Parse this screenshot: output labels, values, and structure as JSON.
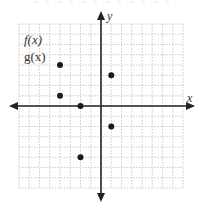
{
  "figure": {
    "top_cropped_text": "{ ... }",
    "axis_labels": {
      "x": "x",
      "y": "y"
    },
    "function_labels": [
      {
        "text": "f(x)"
      },
      {
        "text": "g(x)"
      }
    ],
    "colors": {
      "axis": "#222222",
      "grid": "#bdbdbd",
      "point": "#1a1a1a",
      "text": "#333333"
    }
  },
  "chart_data": {
    "type": "scatter",
    "title": "",
    "xlabel": "x",
    "ylabel": "y",
    "xlim": [
      -8,
      8
    ],
    "ylim": [
      -8,
      8
    ],
    "grid": true,
    "legend_entries": [
      "f(x)",
      "g(x)"
    ],
    "points": [
      {
        "x": -4,
        "y": 4
      },
      {
        "x": 1,
        "y": 3
      },
      {
        "x": -4,
        "y": 1
      },
      {
        "x": -2,
        "y": 0
      },
      {
        "x": 1,
        "y": -2
      },
      {
        "x": -2,
        "y": -5
      }
    ]
  }
}
